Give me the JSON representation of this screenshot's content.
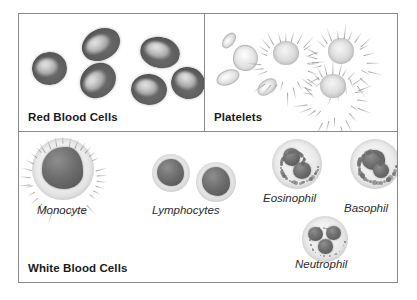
{
  "figure": {
    "name": "blood-cells-diagram",
    "panels": [
      {
        "id": "red-blood-cells",
        "title": "Red Blood Cells",
        "cell_count": 6,
        "labels": []
      },
      {
        "id": "platelets",
        "title": "Platelets",
        "cell_count": 7,
        "labels": []
      },
      {
        "id": "white-blood-cells",
        "title": "White Blood Cells",
        "labels": [
          {
            "id": "monocyte",
            "text": "Monocyte"
          },
          {
            "id": "lymphocytes",
            "text": "Lymphocytes"
          },
          {
            "id": "eosinophil",
            "text": "Eosinophil"
          },
          {
            "id": "basophil",
            "text": "Basophil"
          },
          {
            "id": "neutrophil",
            "text": "Neutrophil"
          }
        ]
      }
    ]
  },
  "colors": {
    "border": "#8a8a8a",
    "background": "#ffffff",
    "title_text": "#1a1a1a",
    "label_text": "#2b2b2b",
    "rbc_body": "#5c5c5c",
    "platelet_body": "#d6d6d6",
    "wbc_cytoplasm": "#e7e7e7",
    "wbc_nucleus": "#6d6d6d"
  }
}
